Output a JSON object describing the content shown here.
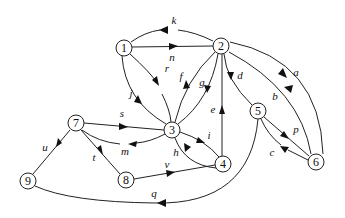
{
  "diagram": {
    "type": "directed-graph",
    "nodes": [
      {
        "id": "1",
        "label": "1",
        "x": 124,
        "y": 48
      },
      {
        "id": "2",
        "label": "2",
        "x": 221,
        "y": 46
      },
      {
        "id": "3",
        "label": "3",
        "x": 172,
        "y": 130
      },
      {
        "id": "4",
        "label": "4",
        "x": 223,
        "y": 164
      },
      {
        "id": "5",
        "label": "5",
        "x": 258,
        "y": 111
      },
      {
        "id": "6",
        "label": "6",
        "x": 316,
        "y": 162
      },
      {
        "id": "7",
        "label": "7",
        "x": 76,
        "y": 123
      },
      {
        "id": "8",
        "label": "8",
        "x": 126,
        "y": 180
      },
      {
        "id": "9",
        "label": "9",
        "x": 28,
        "y": 181
      }
    ],
    "edges": [
      {
        "label": "a",
        "from": "2",
        "to": "6"
      },
      {
        "label": "b",
        "from": "6",
        "to": "2"
      },
      {
        "label": "c",
        "from": "6",
        "to": "5"
      },
      {
        "label": "d",
        "from": "2",
        "to": "5"
      },
      {
        "label": "e",
        "from": "4",
        "to": "2"
      },
      {
        "label": "f",
        "from": "3",
        "to": "2"
      },
      {
        "label": "g",
        "from": "2",
        "to": "3"
      },
      {
        "label": "h",
        "from": "4",
        "to": "3"
      },
      {
        "label": "i",
        "from": "3",
        "to": "4"
      },
      {
        "label": "j",
        "from": "3",
        "to": "1"
      },
      {
        "label": "k",
        "from": "2",
        "to": "1"
      },
      {
        "label": "m",
        "from": "3",
        "to": "7"
      },
      {
        "label": "n",
        "from": "1",
        "to": "2"
      },
      {
        "label": "p",
        "from": "5",
        "to": "6"
      },
      {
        "label": "q",
        "from": "5",
        "to": "9"
      },
      {
        "label": "r",
        "from": "1",
        "to": "3"
      },
      {
        "label": "s",
        "from": "7",
        "to": "3"
      },
      {
        "label": "t",
        "from": "7",
        "to": "8"
      },
      {
        "label": "u",
        "from": "9",
        "to": "7"
      },
      {
        "label": "v",
        "from": "8",
        "to": "4"
      }
    ]
  }
}
